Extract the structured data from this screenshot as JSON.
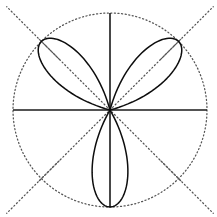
{
  "figure": {
    "background_color": "#ffffff",
    "width": 217,
    "height": 217
  },
  "geometry": {
    "center_x": 110,
    "center_y": 110,
    "radius": 97,
    "diagonal_extent": 100
  },
  "style": {
    "curve_color": "#0d0d0d",
    "axis_color": "#1a1a1a",
    "guide_color": "#555555",
    "curve_stroke_width": 1.5,
    "axis_stroke_width": 1.6,
    "guide_stroke_width": 1.25,
    "guide_dash": "1.1 2.5"
  },
  "chart_data": {
    "type": "line",
    "plot_kind": "polar-rose",
    "title": "",
    "subtitle": "",
    "xlabel": "",
    "ylabel": "",
    "equation": "r = cos(3θ)",
    "petal_count": 3,
    "amplitude": 1,
    "k": 3,
    "grid": true,
    "legend": "none",
    "rlim": [
      0,
      1
    ],
    "theta_range_degrees": [
      0,
      360
    ],
    "axis_lines": [
      {
        "name": "horizontal-axis",
        "angle_degrees": 0,
        "style": "solid",
        "r_from": -1,
        "r_to": 1
      },
      {
        "name": "vertical-axis",
        "angle_degrees": 90,
        "style": "solid",
        "r_from": -1,
        "r_to": 1
      }
    ],
    "guide_lines": [
      {
        "name": "diagonal-45",
        "angle_degrees": 45,
        "style": "dotted",
        "r_from": -1.03,
        "r_to": 1.03
      },
      {
        "name": "diagonal-135",
        "angle_degrees": 135,
        "style": "dotted",
        "r_from": -1.03,
        "r_to": 1.03
      }
    ],
    "guide_circles": [
      {
        "name": "unit-circle",
        "r": 1,
        "style": "dotted"
      }
    ],
    "petals": [
      {
        "name": "upper-left-petal",
        "tip_angle_degrees": 135,
        "tip_r": 1,
        "half_width_degrees": 30
      },
      {
        "name": "upper-right-petal",
        "tip_angle_degrees": 45,
        "tip_r": 1,
        "half_width_degrees": 30
      },
      {
        "name": "lower-petal",
        "tip_angle_degrees": 270,
        "tip_r": 1,
        "half_width_degrees": 30
      }
    ],
    "tick_labels": {
      "r": [],
      "theta": []
    },
    "annotations": []
  }
}
